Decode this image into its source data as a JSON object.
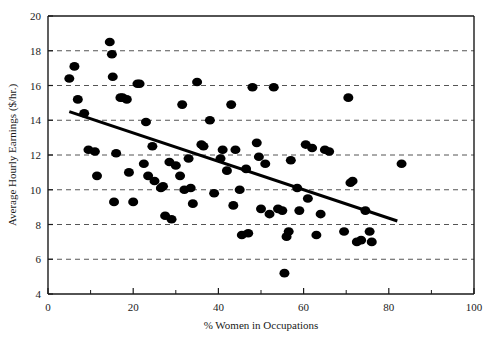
{
  "chart_data": {
    "type": "scatter",
    "title": "",
    "xlabel": "% Women in Occupations",
    "ylabel": "Average Hourly Earnings ($/hr.)",
    "xlim": [
      0,
      100
    ],
    "ylim": [
      4,
      20
    ],
    "x_ticks": [
      0,
      20,
      40,
      60,
      80,
      100
    ],
    "x_minor_ticks": [
      10,
      30,
      50,
      70,
      90
    ],
    "y_ticks": [
      4,
      6,
      8,
      10,
      12,
      14,
      16,
      18,
      20
    ],
    "x_tick_labels": [
      "0",
      "20",
      "40",
      "60",
      "80",
      "100"
    ],
    "y_tick_labels": [
      "4",
      "6",
      "8",
      "10",
      "12",
      "14",
      "16",
      "18",
      "20"
    ],
    "grid": "horizontal-dashed",
    "grid_color": "#555555",
    "legend": "none",
    "marker_color": "#000000",
    "marker_size": 5,
    "points": [
      {
        "x": 5.0,
        "y": 16.4
      },
      {
        "x": 6.2,
        "y": 17.1
      },
      {
        "x": 7.0,
        "y": 15.2
      },
      {
        "x": 8.5,
        "y": 14.4
      },
      {
        "x": 9.5,
        "y": 12.3
      },
      {
        "x": 11.0,
        "y": 12.2
      },
      {
        "x": 11.5,
        "y": 10.8
      },
      {
        "x": 14.5,
        "y": 18.5
      },
      {
        "x": 15.0,
        "y": 17.8
      },
      {
        "x": 15.2,
        "y": 16.5
      },
      {
        "x": 15.5,
        "y": 9.3
      },
      {
        "x": 16.0,
        "y": 12.1
      },
      {
        "x": 17.0,
        "y": 15.3
      },
      {
        "x": 17.5,
        "y": 15.3
      },
      {
        "x": 18.5,
        "y": 15.2
      },
      {
        "x": 19.0,
        "y": 11.0
      },
      {
        "x": 20.0,
        "y": 9.3
      },
      {
        "x": 21.0,
        "y": 16.1
      },
      {
        "x": 21.5,
        "y": 16.1
      },
      {
        "x": 22.5,
        "y": 11.5
      },
      {
        "x": 23.0,
        "y": 13.9
      },
      {
        "x": 23.5,
        "y": 10.8
      },
      {
        "x": 24.5,
        "y": 12.5
      },
      {
        "x": 25.0,
        "y": 10.5
      },
      {
        "x": 26.5,
        "y": 10.1
      },
      {
        "x": 27.0,
        "y": 10.2
      },
      {
        "x": 27.5,
        "y": 8.5
      },
      {
        "x": 28.5,
        "y": 11.6
      },
      {
        "x": 29.0,
        "y": 8.3
      },
      {
        "x": 30.0,
        "y": 11.4
      },
      {
        "x": 31.0,
        "y": 10.8
      },
      {
        "x": 31.5,
        "y": 14.9
      },
      {
        "x": 32.0,
        "y": 10.0
      },
      {
        "x": 33.0,
        "y": 11.8
      },
      {
        "x": 33.5,
        "y": 10.1
      },
      {
        "x": 34.0,
        "y": 9.2
      },
      {
        "x": 35.0,
        "y": 16.2
      },
      {
        "x": 36.0,
        "y": 12.6
      },
      {
        "x": 36.5,
        "y": 12.5
      },
      {
        "x": 38.0,
        "y": 14.0
      },
      {
        "x": 39.0,
        "y": 9.8
      },
      {
        "x": 40.5,
        "y": 11.8
      },
      {
        "x": 41.0,
        "y": 12.3
      },
      {
        "x": 42.0,
        "y": 11.1
      },
      {
        "x": 43.0,
        "y": 14.9
      },
      {
        "x": 43.5,
        "y": 9.1
      },
      {
        "x": 44.0,
        "y": 12.3
      },
      {
        "x": 45.0,
        "y": 10.0
      },
      {
        "x": 45.5,
        "y": 7.4
      },
      {
        "x": 46.5,
        "y": 11.2
      },
      {
        "x": 47.0,
        "y": 7.5
      },
      {
        "x": 48.0,
        "y": 15.9
      },
      {
        "x": 49.0,
        "y": 12.7
      },
      {
        "x": 49.5,
        "y": 11.9
      },
      {
        "x": 50.0,
        "y": 8.9
      },
      {
        "x": 51.0,
        "y": 11.5
      },
      {
        "x": 52.0,
        "y": 8.6
      },
      {
        "x": 53.0,
        "y": 15.9
      },
      {
        "x": 54.0,
        "y": 8.9
      },
      {
        "x": 55.0,
        "y": 8.8
      },
      {
        "x": 55.5,
        "y": 5.2
      },
      {
        "x": 56.0,
        "y": 7.3
      },
      {
        "x": 56.5,
        "y": 7.6
      },
      {
        "x": 57.0,
        "y": 11.7
      },
      {
        "x": 58.5,
        "y": 10.1
      },
      {
        "x": 59.0,
        "y": 8.8
      },
      {
        "x": 60.5,
        "y": 12.6
      },
      {
        "x": 61.0,
        "y": 9.5
      },
      {
        "x": 62.0,
        "y": 12.4
      },
      {
        "x": 63.0,
        "y": 7.4
      },
      {
        "x": 64.0,
        "y": 8.6
      },
      {
        "x": 65.0,
        "y": 12.3
      },
      {
        "x": 66.0,
        "y": 12.2
      },
      {
        "x": 69.5,
        "y": 7.6
      },
      {
        "x": 70.5,
        "y": 15.3
      },
      {
        "x": 71.0,
        "y": 10.4
      },
      {
        "x": 71.5,
        "y": 10.5
      },
      {
        "x": 72.5,
        "y": 7.0
      },
      {
        "x": 73.5,
        "y": 7.1
      },
      {
        "x": 74.5,
        "y": 8.8
      },
      {
        "x": 75.5,
        "y": 7.6
      },
      {
        "x": 76.0,
        "y": 7.0
      },
      {
        "x": 83.0,
        "y": 11.5
      }
    ],
    "trend_line": {
      "name": "regression-line",
      "x_start": 5.0,
      "y_start": 14.5,
      "x_end": 82.0,
      "y_end": 8.2,
      "color": "#000000",
      "width": 3
    }
  }
}
